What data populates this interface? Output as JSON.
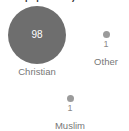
{
  "chart_data": {
    "type": "bubble",
    "title": "% of population)",
    "title_clipped": true,
    "xlabel": "",
    "ylabel": "",
    "categories": [
      "Christian",
      "Muslim",
      "Other"
    ],
    "values": [
      98,
      1,
      1
    ],
    "value_unit": "%",
    "legend": "none",
    "grid": false,
    "colors": {
      "large_bubble": "#6e6e6e",
      "small_bubble": "#9b9b9b",
      "value_inside": "#ffffff",
      "value_outside": "#8a8a8a",
      "label": "#777777",
      "background": "#ffffff",
      "title": "#333333"
    },
    "points": [
      {
        "label": "Christian",
        "value": 98,
        "value_text": "98",
        "value_position": "inside",
        "size": "large"
      },
      {
        "label": "Other",
        "value": 1,
        "value_text": "1",
        "value_position": "below",
        "size": "small"
      },
      {
        "label": "Muslim",
        "value": 1,
        "value_text": "1",
        "value_position": "below",
        "size": "small"
      }
    ]
  }
}
